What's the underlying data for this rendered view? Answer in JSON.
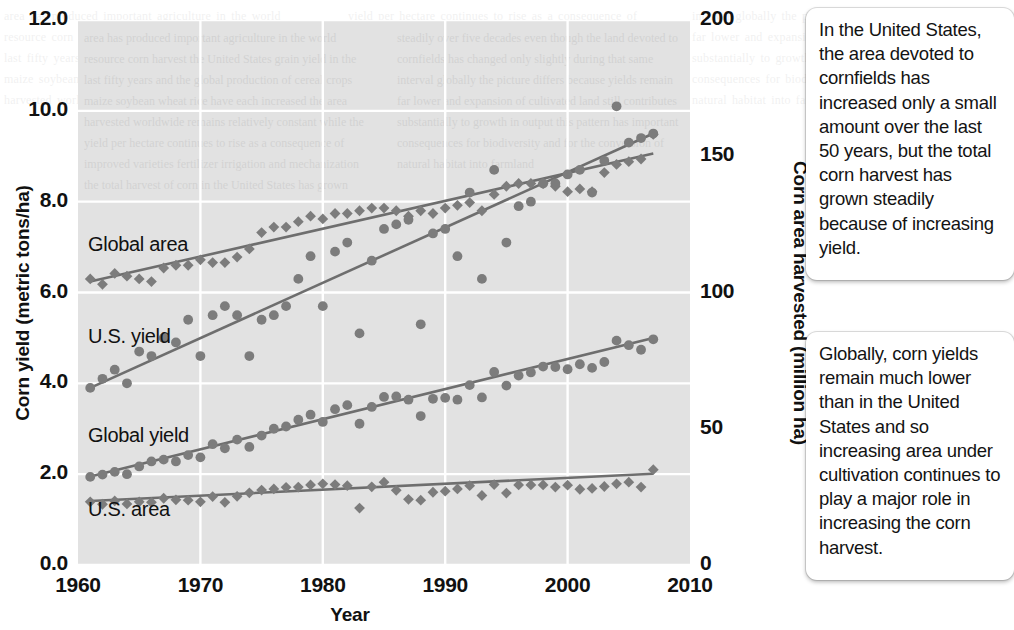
{
  "figure": {
    "xlabel": "Year",
    "ylabel_left": "Corn yield (metric tons/ha)",
    "ylabel_right": "Corn area harvested (million ha)",
    "y_ticks_left": [
      "0.0",
      "2.0",
      "4.0",
      "6.0",
      "8.0",
      "10.0",
      "12.0"
    ],
    "y_ticks_right": [
      "0",
      "50",
      "100",
      "150",
      "200"
    ],
    "x_ticks": [
      "1960",
      "1970",
      "1980",
      "1990",
      "2000",
      "2010"
    ],
    "series_labels": {
      "global_area": "Global area",
      "us_yield": "U.S. yield",
      "global_yield": "Global yield",
      "us_area": "U.S. area"
    },
    "colors": {
      "plot_background": "#e2e2e2",
      "gridline": "#ffffff",
      "marker": "#7c7c7c",
      "trendline": "#6e6e6e",
      "text": "#111111",
      "callout_background": "#ffffff"
    }
  },
  "callouts": [
    {
      "id": "callout-1",
      "text": "In the United States, the area devoted to cornfields has increased only a small amount over the last 50 years, but the total corn harvest has grown steadily because of increasing yield."
    },
    {
      "id": "callout-2",
      "text": "Globally, corn yields remain much lower than in the United States and so increasing area under cultivation continues to play a major role in increasing the corn harvest."
    }
  ],
  "page_bleed_text": "area has produced important agriculture in the world resource corn harvest the United States grain yield in the last fifty years and the global production of cereal crops maize soybean wheat rice have each increased the area harvested worldwide remains relatively constant while the yield per hectare continues to rise as a consequence of improved varieties fertilizer irrigation and mechanization the total harvest of corn in the United States has grown steadily over five decades even though the land devoted to cornfields has changed only slightly during that same interval globally the picture differs because yields remain far lower and expansion of cultivated land still contributes substantially to growth in output this pattern has important consequences for biodiversity and for the conversion of natural habitat into farmland",
  "chart_data": {
    "type": "scatter",
    "title": "",
    "xlabel": "Year",
    "ylabel": "Corn yield (metric tons/ha)",
    "ylabel_secondary": "Corn area harvested (million ha)",
    "xlim": [
      1960,
      2010
    ],
    "ylim": [
      0.0,
      12.0
    ],
    "ylim_secondary": [
      0,
      200
    ],
    "grid": true,
    "legend": "inline-labels",
    "axis_mapping": {
      "left_axis_series": [
        "U.S. yield",
        "Global yield"
      ],
      "right_axis_series": [
        "Global area",
        "U.S. area"
      ],
      "note": "Right axis 0-200 million ha maps onto same pixel span as left axis 0.0-12.0 metric tons/ha"
    },
    "series": [
      {
        "name": "Global area",
        "axis": "right",
        "units": "million ha",
        "marker": "diamond",
        "trendline": {
          "x": [
            1961,
            2007
          ],
          "y": [
            104,
            151
          ]
        },
        "x": [
          1961,
          1962,
          1963,
          1964,
          1965,
          1966,
          1967,
          1968,
          1969,
          1970,
          1971,
          1972,
          1973,
          1974,
          1975,
          1976,
          1977,
          1978,
          1979,
          1980,
          1981,
          1982,
          1983,
          1984,
          1985,
          1986,
          1987,
          1988,
          1989,
          1990,
          1991,
          1992,
          1993,
          1994,
          1995,
          1996,
          1997,
          1998,
          1999,
          2000,
          2001,
          2002,
          2003,
          2004,
          2005,
          2006,
          2007
        ],
        "y": [
          105,
          103,
          107,
          106,
          105,
          104,
          109,
          110,
          110,
          112,
          111,
          111,
          113,
          116,
          122,
          124,
          124,
          126,
          128,
          127,
          129,
          129,
          130,
          131,
          131,
          130,
          128,
          130,
          129,
          131,
          132,
          133,
          130,
          136,
          139,
          140,
          140,
          140,
          139,
          137,
          138,
          137,
          144,
          147,
          148,
          149,
          158
        ]
      },
      {
        "name": "U.S. yield",
        "axis": "left",
        "units": "metric tons/ha",
        "marker": "circle",
        "trendline": {
          "x": [
            1961,
            2007
          ],
          "y": [
            3.9,
            9.5
          ]
        },
        "x": [
          1961,
          1962,
          1963,
          1964,
          1965,
          1966,
          1967,
          1968,
          1969,
          1970,
          1971,
          1972,
          1973,
          1974,
          1975,
          1976,
          1977,
          1978,
          1979,
          1980,
          1981,
          1982,
          1983,
          1984,
          1985,
          1986,
          1987,
          1988,
          1989,
          1990,
          1991,
          1992,
          1993,
          1994,
          1995,
          1996,
          1997,
          1998,
          1999,
          2000,
          2001,
          2002,
          2003,
          2004,
          2005,
          2006,
          2007
        ],
        "y": [
          3.9,
          4.1,
          4.3,
          4.0,
          4.7,
          4.6,
          5.0,
          4.9,
          5.4,
          4.6,
          5.5,
          5.7,
          5.5,
          4.6,
          5.4,
          5.5,
          5.7,
          6.3,
          6.8,
          5.7,
          6.9,
          7.1,
          5.1,
          6.7,
          7.4,
          7.5,
          7.6,
          5.3,
          7.3,
          7.4,
          6.8,
          8.2,
          6.3,
          8.7,
          7.1,
          7.9,
          8.0,
          8.4,
          8.4,
          8.6,
          8.7,
          8.2,
          8.9,
          10.1,
          9.3,
          9.4,
          9.5
        ]
      },
      {
        "name": "Global yield",
        "axis": "left",
        "units": "metric tons/ha",
        "marker": "circle",
        "trendline": {
          "x": [
            1961,
            2007
          ],
          "y": [
            1.95,
            5.0
          ]
        },
        "x": [
          1961,
          1962,
          1963,
          1964,
          1965,
          1966,
          1967,
          1968,
          1969,
          1970,
          1971,
          1972,
          1973,
          1974,
          1975,
          1976,
          1977,
          1978,
          1979,
          1980,
          1981,
          1982,
          1983,
          1984,
          1985,
          1986,
          1987,
          1988,
          1989,
          1990,
          1991,
          1992,
          1993,
          1994,
          1995,
          1996,
          1997,
          1998,
          1999,
          2000,
          2001,
          2002,
          2003,
          2004,
          2005,
          2006,
          2007
        ],
        "y": [
          1.94,
          1.99,
          2.05,
          2.0,
          2.17,
          2.28,
          2.32,
          2.28,
          2.42,
          2.37,
          2.66,
          2.57,
          2.76,
          2.6,
          2.85,
          3.0,
          3.05,
          3.2,
          3.31,
          3.15,
          3.43,
          3.52,
          3.11,
          3.48,
          3.7,
          3.71,
          3.64,
          3.28,
          3.66,
          3.68,
          3.64,
          3.96,
          3.69,
          4.25,
          3.95,
          4.17,
          4.24,
          4.37,
          4.36,
          4.31,
          4.42,
          4.34,
          4.47,
          4.94,
          4.84,
          4.74,
          4.97
        ]
      },
      {
        "name": "U.S. area",
        "axis": "right",
        "units": "million ha",
        "marker": "diamond",
        "trendline": {
          "x": [
            1961,
            2007
          ],
          "y": [
            23.5,
            33.5
          ]
        },
        "x": [
          1961,
          1962,
          1963,
          1964,
          1965,
          1966,
          1967,
          1968,
          1969,
          1970,
          1971,
          1972,
          1973,
          1974,
          1975,
          1976,
          1977,
          1978,
          1979,
          1980,
          1981,
          1982,
          1983,
          1984,
          1985,
          1986,
          1987,
          1988,
          1989,
          1990,
          1991,
          1992,
          1993,
          1994,
          1995,
          1996,
          1997,
          1998,
          1999,
          2000,
          2001,
          2002,
          2003,
          2004,
          2005,
          2006,
          2007
        ],
        "y": [
          23.2,
          22.3,
          23.5,
          22.4,
          23.2,
          23.0,
          24.5,
          23.9,
          23.8,
          23.2,
          25.1,
          23.0,
          25.2,
          26.5,
          27.5,
          27.9,
          28.5,
          28.6,
          29.4,
          29.8,
          29.5,
          29.1,
          20.9,
          28.7,
          30.4,
          27.4,
          24.1,
          23.8,
          26.7,
          27.1,
          27.9,
          29.1,
          25.5,
          29.5,
          26.4,
          29.4,
          29.4,
          29.4,
          28.6,
          29.3,
          27.8,
          28.1,
          28.8,
          29.8,
          30.4,
          28.6,
          35.0
        ]
      }
    ]
  }
}
